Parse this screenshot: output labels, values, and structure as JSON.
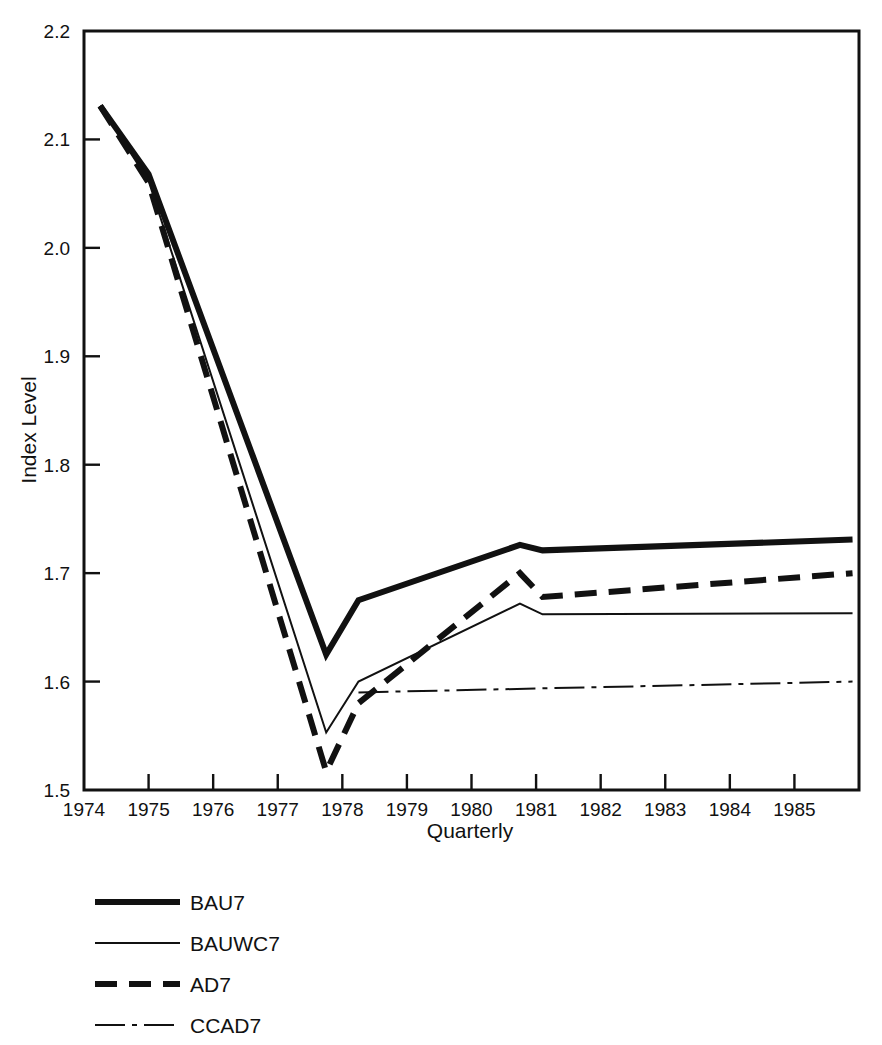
{
  "chart_data": {
    "type": "line",
    "title": "",
    "xlabel": "Quarterly",
    "ylabel": "Index Level",
    "xlim": [
      1974.0,
      1986.0
    ],
    "ylim": [
      1.5,
      2.2
    ],
    "grid": false,
    "legend_position": "below-left",
    "x_tick_labels": [
      "1974",
      "1975",
      "1976",
      "1977",
      "1978",
      "1979",
      "1980",
      "1981",
      "1982",
      "1983",
      "1984",
      "1985"
    ],
    "x_ticks": [
      1974,
      1975,
      1976,
      1977,
      1978,
      1979,
      1980,
      1981,
      1982,
      1983,
      1984,
      1985
    ],
    "y_tick_labels": [
      "1.5",
      "1.6",
      "1.7",
      "1.8",
      "1.9",
      "2.0",
      "2.1",
      "2.2"
    ],
    "y_ticks": [
      1.5,
      1.6,
      1.7,
      1.8,
      1.9,
      2.0,
      2.1,
      2.2
    ],
    "series": [
      {
        "name": "BAU7",
        "style": "solid",
        "width": 6,
        "dash": "none",
        "color": "#111111",
        "x": [
          1974.25,
          1975.0,
          1977.75,
          1978.25,
          1980.75,
          1981.1,
          1985.9
        ],
        "values": [
          2.131,
          2.068,
          1.625,
          1.675,
          1.726,
          1.721,
          1.731
        ]
      },
      {
        "name": "BAUWC7",
        "style": "solid",
        "width": 2,
        "dash": "none",
        "color": "#111111",
        "x": [
          1974.25,
          1975.0,
          1977.75,
          1978.25,
          1980.75,
          1981.1,
          1985.9
        ],
        "values": [
          2.131,
          2.062,
          1.553,
          1.6,
          1.672,
          1.662,
          1.663
        ]
      },
      {
        "name": "AD7",
        "style": "dashed",
        "width": 6,
        "dash": "22 12",
        "color": "#111111",
        "x": [
          1974.25,
          1975.0,
          1977.75,
          1978.25,
          1980.75,
          1981.1,
          1985.9
        ],
        "values": [
          2.131,
          2.06,
          1.517,
          1.58,
          1.7,
          1.678,
          1.7
        ]
      },
      {
        "name": "CCAD7",
        "style": "dash-dot",
        "width": 2,
        "dash": "30 7 5 7",
        "color": "#111111",
        "x": [
          1978.25,
          1985.9
        ],
        "values": [
          1.59,
          1.6
        ]
      }
    ],
    "annotations": []
  },
  "legend": {
    "items": [
      {
        "label": "BAU7",
        "swatch": "thick-solid-line-icon"
      },
      {
        "label": "BAUWC7",
        "swatch": "thin-solid-line-icon"
      },
      {
        "label": "AD7",
        "swatch": "thick-dashed-line-icon"
      },
      {
        "label": "CCAD7",
        "swatch": "thin-dash-dot-line-icon"
      }
    ]
  }
}
